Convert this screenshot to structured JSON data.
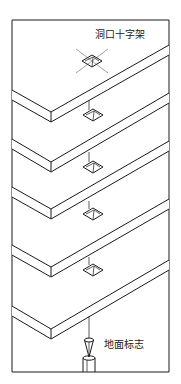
{
  "diagram": {
    "title": "",
    "labels": {
      "top_marker": "洞口十字架",
      "ground_marker": "地面标志"
    },
    "floor_slab_count": 5,
    "slab_openings": 5,
    "components": [
      {
        "name": "floor-slab",
        "count": 5
      },
      {
        "name": "slab-opening",
        "count": 5
      },
      {
        "name": "opening-cross-frame",
        "count": 1
      },
      {
        "name": "plumb-line",
        "count": 1
      },
      {
        "name": "plumb-bob",
        "count": 1
      },
      {
        "name": "ground-mark",
        "count": 1
      }
    ]
  }
}
